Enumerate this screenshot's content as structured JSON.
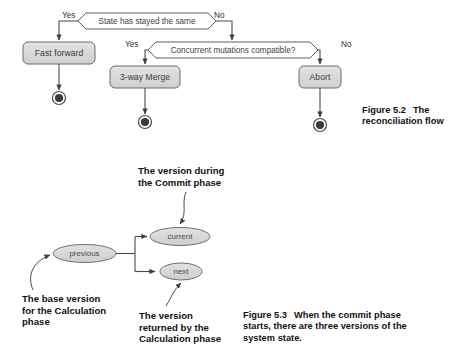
{
  "figure_5_2": {
    "decisions": [
      {
        "id": "state-has-stayed-the-same",
        "label": "State has stayed the same"
      },
      {
        "id": "concurrent-mutations-compatible",
        "label": "Concurrent mutations compatible?"
      }
    ],
    "branch_labels": {
      "d1_yes": "Yes",
      "d1_no": "No",
      "d2_yes": "Yes",
      "d2_no": "No"
    },
    "actions": [
      {
        "id": "fast-forward",
        "label": "Fast forward"
      },
      {
        "id": "three-way-merge",
        "label": "3-way Merge"
      },
      {
        "id": "abort",
        "label": "Abort"
      }
    ],
    "end_states": 3,
    "caption": {
      "number": "Figure 5.2",
      "line1": "The",
      "line2": "reconciliation flow"
    }
  },
  "figure_5_3": {
    "nodes": [
      {
        "id": "previous",
        "label": "previous"
      },
      {
        "id": "current",
        "label": "current"
      },
      {
        "id": "next",
        "label": "next"
      }
    ],
    "annotations": [
      {
        "id": "commit-phase-version",
        "lines": [
          "The version during",
          "the Commit phase"
        ]
      },
      {
        "id": "base-version",
        "lines": [
          "The base version",
          "for the Calculation",
          "phase"
        ]
      },
      {
        "id": "returned-version",
        "lines": [
          "The version",
          "returned by the",
          "Calculation phase"
        ]
      }
    ],
    "caption": {
      "number": "Figure 5.3",
      "line1": "When the commit phase",
      "line2": "starts, there are three versions of the",
      "line3": "system state."
    }
  },
  "colors": {
    "node_fill": "#d9d9d9",
    "node_stroke": "#6b6b6b",
    "hex_fill": "#ffffff",
    "hex_stroke": "#5f5f5f",
    "line": "#4a4a4a",
    "text_dark": "#111111"
  }
}
